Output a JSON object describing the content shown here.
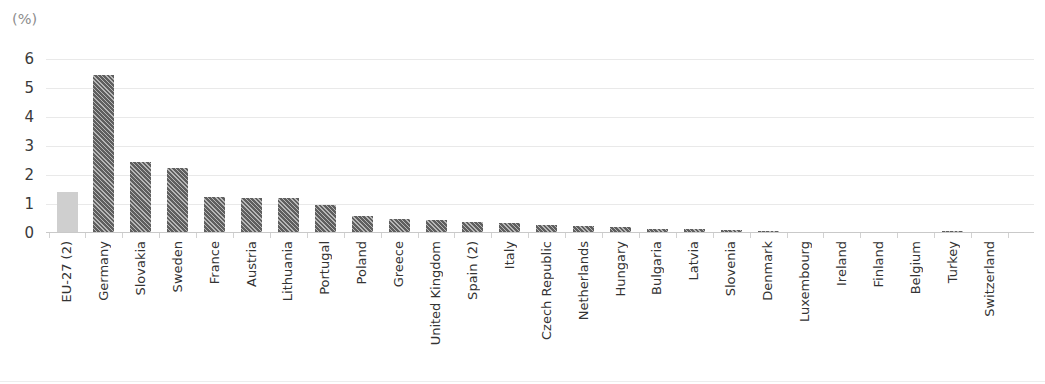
{
  "chart_title": "Share of gross electricity consumption, EU-27 (1)",
  "axis_unit_label": "(%)",
  "chart_data": {
    "type": "bar",
    "title": "Share of gross electricity consumption, EU-27 (1)",
    "xlabel": "",
    "ylabel": "(%)",
    "ylim": [
      0,
      6
    ],
    "ytick_labels": [
      "0",
      "1",
      "2",
      "3",
      "4",
      "5",
      "6"
    ],
    "ytick_values": [
      0,
      1,
      2,
      3,
      4,
      5,
      6
    ],
    "grid": true,
    "legend": "none",
    "highlight_category": "EU-27 (2)",
    "highlight_color": "#cfcfcf",
    "bar_color": "#5f5f5f",
    "categories": [
      "EU-27 (2)",
      "Germany",
      "Slovakia",
      "Sweden",
      "France",
      "Austria",
      "Lithuania",
      "Portugal",
      "Poland",
      "Greece",
      "United Kingdom",
      "Spain (2)",
      "Italy",
      "Czech Republic",
      "Netherlands",
      "Hungary",
      "Bulgaria",
      "Latvia",
      "Slovenia",
      "Denmark",
      "Luxembourg",
      "Ireland",
      "Finland",
      "Belgium",
      "Turkey",
      "Switzerland"
    ],
    "values": [
      1.4,
      5.45,
      2.45,
      2.25,
      1.25,
      1.2,
      1.2,
      0.95,
      0.6,
      0.5,
      0.45,
      0.38,
      0.33,
      0.26,
      0.25,
      0.2,
      0.15,
      0.14,
      0.1,
      0.08,
      0.04,
      0.03,
      0.03,
      0.02,
      0.07,
      0.03
    ]
  }
}
